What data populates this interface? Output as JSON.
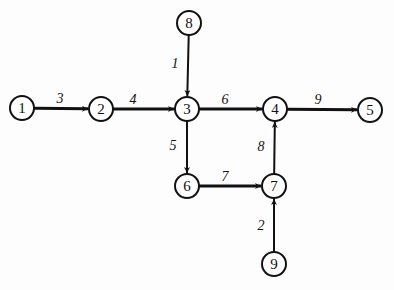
{
  "diagram": {
    "type": "directed-network",
    "nodes": [
      {
        "id": "1",
        "label": "1",
        "x": 22,
        "y": 108
      },
      {
        "id": "2",
        "label": "2",
        "x": 101,
        "y": 109
      },
      {
        "id": "3",
        "label": "3",
        "x": 187,
        "y": 109
      },
      {
        "id": "4",
        "label": "4",
        "x": 275,
        "y": 109
      },
      {
        "id": "5",
        "label": "5",
        "x": 370,
        "y": 110
      },
      {
        "id": "6",
        "label": "6",
        "x": 187,
        "y": 186
      },
      {
        "id": "7",
        "label": "7",
        "x": 274,
        "y": 186
      },
      {
        "id": "8",
        "label": "8",
        "x": 189,
        "y": 23
      },
      {
        "id": "9",
        "label": "9",
        "x": 274,
        "y": 264
      }
    ],
    "edges": [
      {
        "from": "1",
        "to": "2",
        "label": "3",
        "lx": 60,
        "ly": 103,
        "width": 3
      },
      {
        "from": "2",
        "to": "3",
        "label": "4",
        "lx": 133,
        "ly": 104,
        "width": 3
      },
      {
        "from": "8",
        "to": "3",
        "label": "1",
        "lx": 175,
        "ly": 68,
        "width": 2
      },
      {
        "from": "3",
        "to": "4",
        "label": "6",
        "lx": 225,
        "ly": 104,
        "width": 3
      },
      {
        "from": "4",
        "to": "5",
        "label": "9",
        "lx": 318,
        "ly": 104,
        "width": 3
      },
      {
        "from": "3",
        "to": "6",
        "label": "5",
        "lx": 173,
        "ly": 150,
        "width": 2
      },
      {
        "from": "6",
        "to": "7",
        "label": "7",
        "lx": 225,
        "ly": 181,
        "width": 3
      },
      {
        "from": "7",
        "to": "4",
        "label": "8",
        "lx": 261,
        "ly": 151,
        "width": 2
      },
      {
        "from": "9",
        "to": "7",
        "label": "2",
        "lx": 261,
        "ly": 230,
        "width": 2
      }
    ]
  }
}
